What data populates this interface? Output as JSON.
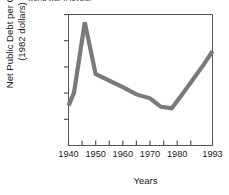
{
  "caption": {
    "text": "world war II levels."
  },
  "chart_data": {
    "type": "line",
    "title": "",
    "xlabel": "Years",
    "ylabel_line1": "Net Public Debt per Capita",
    "ylabel_line2": "(1982 dollars)",
    "xlim": [
      1940,
      1993
    ],
    "ylim": [
      0,
      10000
    ],
    "grid": false,
    "legend": null,
    "line_color": "#7a7a7a",
    "axis_color": "#555555",
    "x_major_ticks": [
      1940,
      1950,
      1960,
      1970,
      1980,
      1993
    ],
    "x_major_tick_labels": [
      "1940",
      "1950",
      "1960",
      "1970",
      "1980",
      "1993"
    ],
    "x_minor_ticks": [
      1945,
      1955,
      1965,
      1975,
      1985
    ],
    "y_ticks": [
      2000,
      4000,
      6000,
      8000,
      10000
    ],
    "y_tick_labels": [
      "2000",
      "4000",
      "6000",
      "8000",
      "10,000"
    ],
    "series": [
      {
        "name": "Net Public Debt per Capita",
        "x": [
          1940,
          1942,
          1946,
          1950,
          1955,
          1960,
          1965,
          1970,
          1974,
          1978,
          1982,
          1986,
          1990,
          1993
        ],
        "values": [
          3050,
          4000,
          9400,
          5450,
          4950,
          4450,
          3900,
          3600,
          2950,
          2850,
          3950,
          5100,
          6250,
          7200
        ]
      }
    ]
  }
}
